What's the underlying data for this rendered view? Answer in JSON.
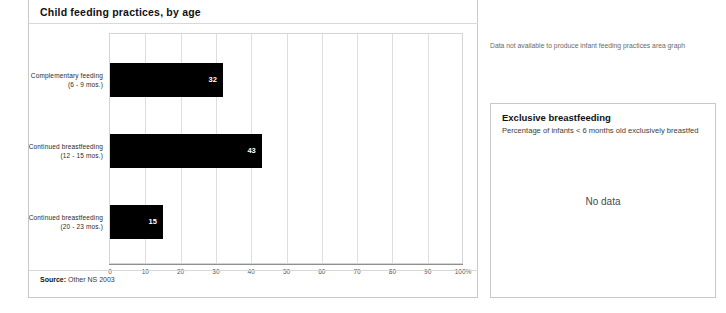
{
  "panel": {
    "title": "Child feeding practices, by age",
    "source_label": "Source:",
    "source_value": "Other NS 2003"
  },
  "note": {
    "text": "Data not available to produce infant feeding practices area graph"
  },
  "breastfeeding_box": {
    "title": "Exclusive breastfeeding",
    "subtitle": "Percentage of infants < 6 months old exclusively breastfed",
    "no_data": "No data"
  },
  "chart_data": {
    "type": "bar",
    "orientation": "horizontal",
    "title": "Child feeding practices, by age",
    "xlabel": "",
    "ylabel": "",
    "xlim": [
      0,
      100
    ],
    "grid": true,
    "legend": "none",
    "categories": [
      "Complementary feeding (6 - 9 mos.)",
      "Continued breastfeeding (12 - 15 mos.)",
      "Continued breastfeeding (20 - 23 mos.)"
    ],
    "category_lines": [
      [
        "Complementary feeding",
        "(6 - 9 mos.)"
      ],
      [
        "Continued breastfeeding",
        "(12 - 15 mos.)"
      ],
      [
        "Continued breastfeeding",
        "(20 - 23 mos.)"
      ]
    ],
    "values": [
      32,
      43,
      15
    ],
    "value_labels": [
      "32",
      "43",
      "15"
    ],
    "tick_values": [
      0,
      10,
      20,
      30,
      40,
      50,
      60,
      70,
      80,
      90,
      100
    ],
    "tick_labels": [
      "0",
      "10",
      "20",
      "30",
      "40",
      "50",
      "60",
      "70",
      "80",
      "90",
      "100%"
    ],
    "bar_color": "#000000",
    "value_label_color": "#ffffff"
  }
}
